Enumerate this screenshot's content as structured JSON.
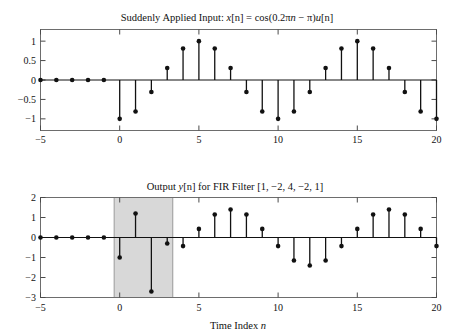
{
  "figure": {
    "width": 454,
    "height": 336,
    "background": "#ffffff",
    "xlabel": "Time Index n"
  },
  "chart_data": [
    {
      "type": "stem",
      "id": "input-signal",
      "title": "Suddenly Applied Input: x[n] = cos(0.2πn − π)u[n]",
      "title_parts": {
        "prefix": "Suddenly Applied Input: ",
        "var": "x",
        "index": "[n]",
        "eq": " = cos(0.2",
        "pi1": "π",
        "nvar": "n",
        "minus": " − ",
        "pi2": "π",
        "close": ")",
        "uvar": "u",
        "uindex": "[n]"
      },
      "xlabel": "",
      "ylabel": "",
      "xlim": [
        -5,
        20
      ],
      "ylim": [
        -1.3,
        1.3
      ],
      "xticks": [
        -5,
        0,
        5,
        10,
        15,
        20
      ],
      "xticklabels": [
        "−5",
        "0",
        "5",
        "10",
        "15",
        "20"
      ],
      "yticks": [
        1,
        0.5,
        0,
        -0.5,
        -1
      ],
      "yticklabels": [
        "1",
        "0.5",
        "0",
        "−0.5",
        "−1"
      ],
      "grid": false,
      "legend": null,
      "x": [
        -5,
        -4,
        -3,
        -2,
        -1,
        0,
        1,
        2,
        3,
        4,
        5,
        6,
        7,
        8,
        9,
        10,
        11,
        12,
        13,
        14,
        15,
        16,
        17,
        18,
        19,
        20
      ],
      "values": [
        0,
        0,
        0,
        0,
        0,
        -1,
        -0.809,
        -0.309,
        0.309,
        0.809,
        1,
        0.809,
        0.309,
        -0.309,
        -0.809,
        -1,
        -0.809,
        -0.309,
        0.309,
        0.809,
        1,
        0.809,
        0.309,
        -0.309,
        -0.809,
        -1
      ]
    },
    {
      "type": "stem",
      "id": "output-signal",
      "title": "Output y[n] for FIR Filter [1, −2, 4, −2, 1]",
      "title_parts": {
        "prefix": "Output ",
        "var": "y",
        "index": "[n]",
        "suffix": " for FIR Filter [1, −2, 4, −2, 1]"
      },
      "xlabel": "Time Index n",
      "ylabel": "",
      "xlim": [
        -5,
        20
      ],
      "ylim": [
        -3,
        2
      ],
      "xticks": [
        -5,
        0,
        5,
        10,
        15,
        20
      ],
      "xticklabels": [
        "−5",
        "0",
        "5",
        "10",
        "15",
        "20"
      ],
      "yticks": [
        2,
        1,
        0,
        -1,
        -2,
        -3
      ],
      "yticklabels": [
        "2",
        "1",
        "0",
        "−1",
        "−2",
        "−3"
      ],
      "grid": false,
      "legend": null,
      "filter_coefficients": [
        1,
        -2,
        4,
        -2,
        1
      ],
      "highlight_region": {
        "x_start": -0.35,
        "x_end": 3.35,
        "color": "#d8d8d8",
        "meaning": "transient-region"
      },
      "x": [
        -5,
        -4,
        -3,
        -2,
        -1,
        0,
        1,
        2,
        3,
        4,
        5,
        6,
        7,
        8,
        9,
        10,
        11,
        12,
        13,
        14,
        15,
        16,
        17,
        18,
        19,
        20
      ],
      "values": [
        0,
        0,
        0,
        0,
        0,
        -1,
        1.2,
        -2.7,
        -0.3,
        -0.43,
        0.43,
        1.15,
        1.4,
        1.15,
        0.43,
        -0.43,
        -1.15,
        -1.4,
        -1.15,
        -0.43,
        0.43,
        1.15,
        1.4,
        1.15,
        0.43,
        -0.43
      ]
    }
  ]
}
